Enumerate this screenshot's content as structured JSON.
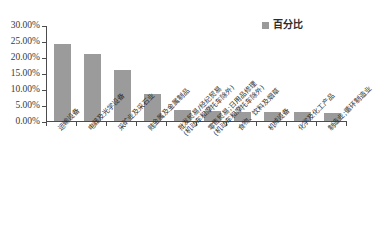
{
  "chart_data": {
    "type": "bar",
    "title": "",
    "subtitle": "",
    "xlabel": "",
    "ylabel": "",
    "ylim": [
      0,
      30
    ],
    "ytick_labels": [
      "0.00%",
      "5.00%",
      "10.00%",
      "15.00%",
      "20.00%",
      "25.00%",
      "30.00%"
    ],
    "ytick_values": [
      0,
      5,
      10,
      15,
      20,
      25,
      30
    ],
    "grid": false,
    "legend_position": "top-right",
    "legend": [
      "百分比"
    ],
    "bar_color": "#9b9b9b",
    "categories": [
      "运输设备",
      "电器及光学设备",
      "采矿业及采石业",
      "贱金属及金属制品",
      "批发贸易/经纪贸易(机动车和摩托车除外)",
      "零售贸易;日用品修理(机动车和摩托车除外)",
      "食物、饮料及烟草",
      "机械设备",
      "化学及化工产品",
      "制造业;循环制造业"
    ],
    "category_lines": [
      [
        "运输设备"
      ],
      [
        "电器及光学设备"
      ],
      [
        "采矿业及采石业"
      ],
      [
        "贱金属及金属制品"
      ],
      [
        "批发贸易/经纪贸易",
        "(机动车和摩托车除外)"
      ],
      [
        "零售贸易;日用品修理",
        "(机动车和摩托车除外)"
      ],
      [
        "食物、饮料及烟草"
      ],
      [
        "机械设备"
      ],
      [
        "化学及化工产品"
      ],
      [
        "制造业;循环制造业"
      ]
    ],
    "series": [
      {
        "name": "百分比",
        "values": [
          24.0,
          21.0,
          16.0,
          8.3,
          3.5,
          3.0,
          2.8,
          2.8,
          2.8,
          2.5
        ]
      }
    ]
  }
}
